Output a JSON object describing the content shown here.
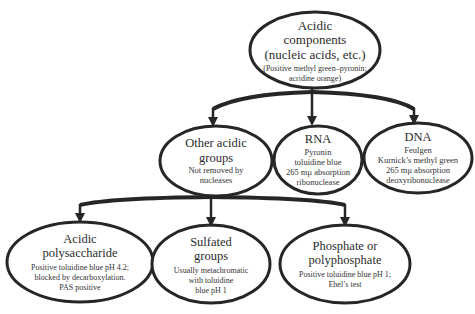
{
  "diagram": {
    "root": {
      "title_lines": [
        "Acidic",
        "components",
        "(nucleic acids, etc.)"
      ],
      "desc_lines": [
        "(Positive methyl green–pyronin;",
        "acridine orange)"
      ]
    },
    "level1": [
      {
        "id": "other-acidic-groups",
        "title_lines": [
          "Other acidic",
          "groups"
        ],
        "desc_lines": [
          "Not removed by",
          "nucleases"
        ]
      },
      {
        "id": "rna",
        "title_lines": [
          "RNA"
        ],
        "desc_lines": [
          "Pyronin",
          "toluidine blue",
          "265 mμ absorption",
          "ribonuclease"
        ]
      },
      {
        "id": "dna",
        "title_lines": [
          "DNA"
        ],
        "desc_lines": [
          "Feulgen",
          "Kurnick’s methyl green",
          "265 mμ absorption",
          "deoxyribonuclease"
        ]
      }
    ],
    "level2": [
      {
        "id": "acidic-polysaccharide",
        "title_lines": [
          "Acidic",
          "polysaccharide"
        ],
        "desc_lines": [
          "Positive toluidine blue pH 4.2;",
          "blocked by decarboxylation.",
          "PAS positive"
        ]
      },
      {
        "id": "sulfated-groups",
        "title_lines": [
          "Sulfated",
          "groups"
        ],
        "desc_lines": [
          "Usually metachromatic",
          "with toluidine",
          "blue pH 1"
        ]
      },
      {
        "id": "phosphate-or-polyphosphate",
        "title_lines": [
          "Phosphate or",
          "polyphosphate"
        ],
        "desc_lines": [
          "Positive toluidine blue pH 1;",
          "Ehel’s test"
        ]
      }
    ],
    "colors": {
      "stroke": "#262626",
      "text": "#2b2b2b",
      "background": "#ffffff"
    }
  }
}
